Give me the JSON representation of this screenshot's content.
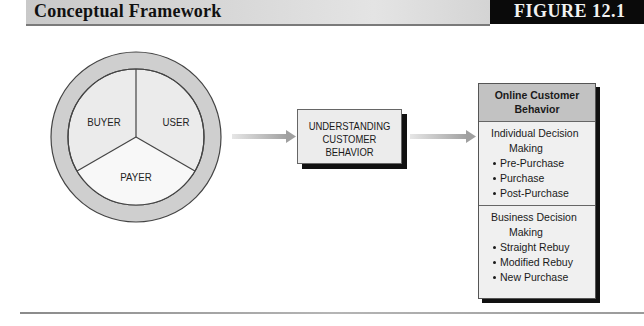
{
  "header": {
    "title": "Conceptual Framework",
    "figure_label": "FIGURE 12.1"
  },
  "wheel": {
    "segments": [
      {
        "label": "BUYER"
      },
      {
        "label": "USER"
      },
      {
        "label": "PAYER"
      }
    ],
    "colors": {
      "ring": "#cfcfcf",
      "segment_top": "#ebebeb",
      "segment_bottom": "#f7f7f7",
      "stroke": "#444444"
    }
  },
  "center_box": {
    "lines": [
      "UNDERSTANDING",
      "CUSTOMER",
      "BEHAVIOR"
    ]
  },
  "right_box": {
    "title_lines": [
      "Online Customer",
      "Behavior"
    ],
    "sections": [
      {
        "title_line1": "Individual Decision",
        "title_line2": "Making",
        "items": [
          "Pre-Purchase",
          "Purchase",
          "Post-Purchase"
        ]
      },
      {
        "title_line1": "Business Decision",
        "title_line2": "Making",
        "items": [
          "Straight Rebuy",
          "Modified Rebuy",
          "New Purchase"
        ]
      }
    ]
  },
  "arrows": {
    "color": "#a8a8a8"
  }
}
